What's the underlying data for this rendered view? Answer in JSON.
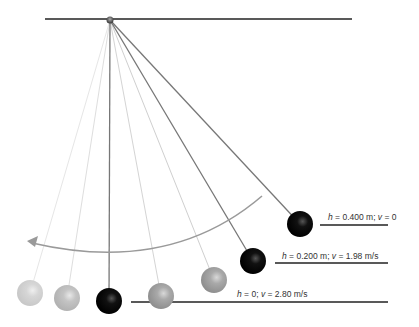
{
  "diagram": {
    "type": "pendulum-energy",
    "pivot": {
      "x": 110,
      "y": 20
    },
    "ceiling": {
      "x1": 45,
      "x2": 352,
      "y": 19
    },
    "swing_arrow": {
      "direction": "right-to-left"
    },
    "bobs": [
      {
        "name": "ghost-bob-far-left",
        "x": 30,
        "y": 293,
        "style": "faint"
      },
      {
        "name": "ghost-bob-left",
        "x": 67,
        "y": 298,
        "style": "light"
      },
      {
        "name": "bob-bottom",
        "x": 109,
        "y": 301,
        "style": "solid"
      },
      {
        "name": "ghost-bob-right-1",
        "x": 161,
        "y": 296,
        "style": "gray"
      },
      {
        "name": "ghost-bob-right-2",
        "x": 214,
        "y": 280,
        "style": "gray"
      },
      {
        "name": "bob-middle",
        "x": 253,
        "y": 261,
        "style": "solid"
      },
      {
        "name": "bob-top",
        "x": 300,
        "y": 224,
        "style": "solid"
      }
    ],
    "labels": [
      {
        "h_var": "h",
        "h_val": " = 0.400 m; ",
        "v_var": "v",
        "v_val": " = 0",
        "x": 328,
        "y": 212,
        "line_x1": 320,
        "line_x2": 388,
        "line_y": 225
      },
      {
        "h_var": "h",
        "h_val": " = 0.200 m; ",
        "v_var": "v",
        "v_val": " = 1.98 m/s",
        "x": 282,
        "y": 251,
        "line_x1": 275,
        "line_x2": 388,
        "line_y": 263
      },
      {
        "h_var": "h",
        "h_val": " = 0; ",
        "v_var": "v",
        "v_val": " = 2.80 m/s",
        "x": 237,
        "y": 289,
        "line_x1": 131,
        "line_x2": 388,
        "line_y": 302
      }
    ]
  }
}
